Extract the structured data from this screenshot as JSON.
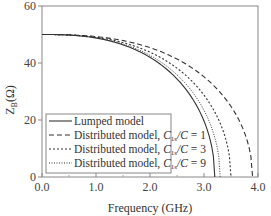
{
  "chart_data": {
    "type": "line",
    "title": "",
    "xlabel": "Frequency (GHz)",
    "ylabel": "Z_B(Ω)",
    "ylabel_main": "Z",
    "ylabel_sub": "B",
    "ylabel_unit": "(Ω)",
    "xlim": [
      0.0,
      4.0
    ],
    "ylim": [
      0,
      60
    ],
    "x_ticks": [
      0.0,
      1.0,
      2.0,
      3.0,
      4.0
    ],
    "x_tick_labels": [
      "0.0",
      "1.0",
      "2.0",
      "3.0",
      "4.0"
    ],
    "x_minor_ticks": [
      0.5,
      1.5,
      2.5,
      3.5
    ],
    "y_ticks": [
      0,
      20,
      40,
      60
    ],
    "y_tick_labels": [
      "0",
      "20",
      "40",
      "60"
    ],
    "grid": false,
    "legend_position": "lower left",
    "x": [
      0.0,
      0.25,
      0.5,
      0.75,
      1.0,
      1.25,
      1.5,
      1.75,
      2.0,
      2.25,
      2.5,
      2.75,
      3.0,
      3.1,
      3.2,
      3.3,
      3.4,
      3.5,
      3.6,
      3.7,
      3.8,
      3.9
    ],
    "series": [
      {
        "name": "Lumped model",
        "style": "solid",
        "cutoff_ghz": 3.2,
        "values": [
          50.0,
          49.7,
          48.8,
          47.2,
          45.0,
          42.1,
          38.4,
          33.9,
          28.4,
          21.8,
          13.3,
          5.6,
          0.0,
          0.0,
          0.0,
          null,
          null,
          null,
          null,
          null,
          null,
          null
        ]
      },
      {
        "name": "Distributed model, C1s/C = 1",
        "style": "dashed",
        "cutoff_ghz": 3.9,
        "values": [
          50.0,
          49.8,
          49.2,
          48.1,
          46.6,
          44.6,
          42.1,
          39.1,
          35.5,
          31.3,
          26.4,
          20.7,
          14.3,
          12.6,
          10.8,
          8.9,
          6.9,
          5.0,
          3.2,
          1.6,
          0.5,
          0.0
        ]
      },
      {
        "name": "Distributed model, C1s/C = 3",
        "style": "dotted-coarse",
        "cutoff_ghz": 3.5,
        "values": [
          50.0,
          49.7,
          49.0,
          47.7,
          45.8,
          43.4,
          40.3,
          36.5,
          31.9,
          26.4,
          19.7,
          12.2,
          5.8,
          4.0,
          2.4,
          1.0,
          0.2,
          0.0,
          null,
          null,
          null,
          null
        ]
      },
      {
        "name": "Distributed model, C1s/C = 9",
        "style": "dotted-fine",
        "cutoff_ghz": 3.3,
        "values": [
          50.0,
          49.7,
          48.8,
          47.4,
          45.3,
          42.6,
          39.1,
          34.8,
          29.7,
          23.4,
          15.6,
          7.6,
          2.1,
          1.0,
          0.3,
          0.0,
          null,
          null,
          null,
          null,
          null,
          null
        ]
      }
    ]
  },
  "legend": {
    "items": [
      {
        "label_prefix": "Lumped model",
        "label_var": "",
        "label_value": ""
      },
      {
        "label_prefix": "Distributed model, ",
        "label_var": "C1s/C",
        "label_value": "= 1"
      },
      {
        "label_prefix": "Distributed model, ",
        "label_var": "C1s/C",
        "label_value": "= 3"
      },
      {
        "label_prefix": "Distributed model, ",
        "label_var": "C1s/C",
        "label_value": "= 9"
      }
    ]
  },
  "colors": {
    "axis": "#777777",
    "line": "#333333",
    "text": "#333333",
    "background": "#ffffff"
  }
}
